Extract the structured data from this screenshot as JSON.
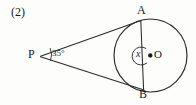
{
  "figure": {
    "item_number": "(2)",
    "type": "circle-tangent-geometry-diagram",
    "background_color": "#fdfdfb",
    "stroke_color": "#1b1b1b",
    "labels": {
      "external_point": "P",
      "tangent_point_top": "A",
      "tangent_point_bottom": "B",
      "center": "O",
      "unknown_angle": "x",
      "angle_at_P": "35°"
    },
    "geometry": {
      "circle": {
        "cx": 150.5,
        "cy": 55.5,
        "r": 36.5
      },
      "center_dot_r": 2.2,
      "point_P": {
        "x": 40,
        "y": 56
      },
      "point_A": {
        "x": 140.5,
        "y": 20.5
      },
      "point_B": {
        "x": 143.5,
        "y": 90
      },
      "angle_arc_P": {
        "r": 11
      },
      "angle_arc_O": {
        "r": 9
      }
    }
  }
}
